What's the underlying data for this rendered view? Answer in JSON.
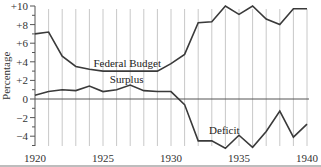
{
  "chart_data": {
    "type": "line",
    "title": "",
    "xlabel": "",
    "ylabel": "Percentage",
    "x": [
      1920,
      1921,
      1922,
      1923,
      1924,
      1925,
      1926,
      1927,
      1928,
      1929,
      1930,
      1931,
      1932,
      1933,
      1934,
      1935,
      1936,
      1937,
      1938,
      1939,
      1940
    ],
    "xlim": [
      1920,
      1940
    ],
    "ylim": [
      -5,
      10
    ],
    "x_ticks": [
      "1920",
      "1925",
      "1930",
      "1935",
      "1940"
    ],
    "y_ticks": [
      "+10",
      "+8",
      "+6",
      "+4",
      "+2",
      "0",
      "−2",
      "−4"
    ],
    "y_tick_values": [
      10,
      8,
      6,
      4,
      2,
      0,
      -2,
      -4
    ],
    "grid": {
      "vertical": true,
      "horizontal": false,
      "zero_line": true
    },
    "legend": null,
    "series": [
      {
        "name": "Federal Budget",
        "values": [
          7.0,
          7.2,
          4.6,
          3.5,
          3.2,
          3.0,
          3.0,
          3.0,
          3.0,
          3.0,
          3.8,
          4.8,
          8.2,
          8.3,
          10.0,
          9.1,
          10.0,
          8.6,
          8.0,
          9.7,
          9.7
        ]
      },
      {
        "name": "Surplus / Deficit",
        "values": [
          0.4,
          0.8,
          1.0,
          0.9,
          1.4,
          0.8,
          1.0,
          1.5,
          0.9,
          0.8,
          0.8,
          -0.6,
          -4.5,
          -4.5,
          -5.3,
          -3.9,
          -5.2,
          -3.5,
          -1.3,
          -4.1,
          -2.7
        ]
      }
    ],
    "annotations": [
      {
        "text": "Federal Budget",
        "year": 1924.3,
        "value": 3.4
      },
      {
        "text": "Surplus",
        "year": 1925.5,
        "value": 1.7
      },
      {
        "text": "Deficit",
        "year": 1932.8,
        "value": -3.8
      }
    ]
  },
  "colors": {
    "line": "#3a3a3a",
    "grid": "#c8c8c8",
    "axis": "#555555",
    "bottom_rule": "#bdbdbd"
  }
}
